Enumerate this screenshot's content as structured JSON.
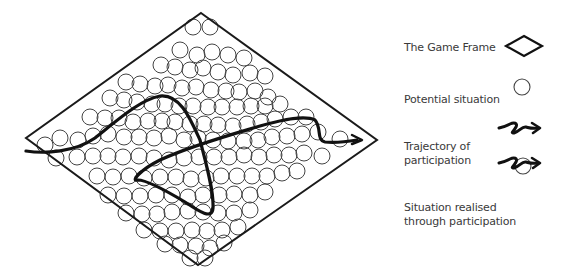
{
  "diagram": {
    "frame_color": "#1a1a1a",
    "circle_color": "#444444",
    "trajectory_color": "#111111",
    "frame": {
      "top": [
        201,
        13
      ],
      "right": [
        377,
        140
      ],
      "bottom": [
        198,
        265
      ],
      "left": [
        26,
        138
      ]
    },
    "circles": [
      [
        193,
        27
      ],
      [
        210,
        27
      ],
      [
        180,
        50
      ],
      [
        197,
        55
      ],
      [
        212,
        52
      ],
      [
        228,
        55
      ],
      [
        244,
        58
      ],
      [
        161,
        65
      ],
      [
        175,
        67
      ],
      [
        190,
        70
      ],
      [
        203,
        68
      ],
      [
        218,
        72
      ],
      [
        233,
        75
      ],
      [
        250,
        73
      ],
      [
        265,
        76
      ],
      [
        126,
        82
      ],
      [
        140,
        84
      ],
      [
        155,
        86
      ],
      [
        168,
        85
      ],
      [
        182,
        88
      ],
      [
        196,
        87
      ],
      [
        211,
        90
      ],
      [
        226,
        91
      ],
      [
        239,
        92
      ],
      [
        255,
        91
      ],
      [
        268,
        97
      ],
      [
        110,
        98
      ],
      [
        124,
        100
      ],
      [
        137,
        102
      ],
      [
        152,
        104
      ],
      [
        165,
        104
      ],
      [
        179,
        106
      ],
      [
        193,
        106
      ],
      [
        208,
        107
      ],
      [
        222,
        107
      ],
      [
        237,
        107
      ],
      [
        251,
        106
      ],
      [
        265,
        106
      ],
      [
        280,
        104
      ],
      [
        90,
        117
      ],
      [
        105,
        118
      ],
      [
        119,
        118
      ],
      [
        133,
        122
      ],
      [
        148,
        121
      ],
      [
        162,
        121
      ],
      [
        175,
        122
      ],
      [
        190,
        124
      ],
      [
        204,
        124
      ],
      [
        218,
        125
      ],
      [
        233,
        126
      ],
      [
        247,
        124
      ],
      [
        261,
        122
      ],
      [
        275,
        119
      ],
      [
        291,
        117
      ],
      [
        306,
        117
      ],
      [
        45,
        145
      ],
      [
        60,
        138
      ],
      [
        78,
        140
      ],
      [
        93,
        136
      ],
      [
        108,
        134
      ],
      [
        124,
        137
      ],
      [
        139,
        137
      ],
      [
        154,
        138
      ],
      [
        169,
        136
      ],
      [
        184,
        140
      ],
      [
        198,
        138
      ],
      [
        213,
        140
      ],
      [
        228,
        141
      ],
      [
        244,
        141
      ],
      [
        258,
        140
      ],
      [
        272,
        137
      ],
      [
        287,
        136
      ],
      [
        302,
        134
      ],
      [
        318,
        132
      ],
      [
        340,
        139
      ],
      [
        56,
        158
      ],
      [
        77,
        157
      ],
      [
        93,
        156
      ],
      [
        108,
        156
      ],
      [
        123,
        157
      ],
      [
        139,
        156
      ],
      [
        154,
        158
      ],
      [
        169,
        160
      ],
      [
        184,
        158
      ],
      [
        199,
        157
      ],
      [
        214,
        157
      ],
      [
        229,
        157
      ],
      [
        244,
        155
      ],
      [
        259,
        157
      ],
      [
        274,
        155
      ],
      [
        289,
        155
      ],
      [
        304,
        153
      ],
      [
        322,
        156
      ],
      [
        97,
        176
      ],
      [
        113,
        177
      ],
      [
        129,
        176
      ],
      [
        144,
        178
      ],
      [
        160,
        177
      ],
      [
        176,
        177
      ],
      [
        191,
        179
      ],
      [
        206,
        178
      ],
      [
        221,
        176
      ],
      [
        237,
        176
      ],
      [
        252,
        176
      ],
      [
        267,
        176
      ],
      [
        282,
        173
      ],
      [
        297,
        171
      ],
      [
        108,
        195
      ],
      [
        124,
        196
      ],
      [
        140,
        196
      ],
      [
        156,
        195
      ],
      [
        172,
        195
      ],
      [
        188,
        197
      ],
      [
        203,
        195
      ],
      [
        219,
        195
      ],
      [
        234,
        194
      ],
      [
        250,
        195
      ],
      [
        265,
        192
      ],
      [
        126,
        213
      ],
      [
        142,
        214
      ],
      [
        157,
        214
      ],
      [
        172,
        212
      ],
      [
        188,
        211
      ],
      [
        203,
        212
      ],
      [
        218,
        213
      ],
      [
        234,
        213
      ],
      [
        250,
        210
      ],
      [
        144,
        230
      ],
      [
        160,
        231
      ],
      [
        176,
        231
      ],
      [
        192,
        230
      ],
      [
        207,
        231
      ],
      [
        222,
        230
      ],
      [
        238,
        227
      ],
      [
        165,
        244
      ],
      [
        180,
        245
      ],
      [
        196,
        246
      ],
      [
        210,
        248
      ],
      [
        224,
        243
      ],
      [
        190,
        258
      ],
      [
        205,
        258
      ]
    ],
    "trajectory_path": "M 26 151 C 45 154, 75 152, 95 138 C 120 118, 140 100, 160 96 C 180 94, 190 118, 200 140 C 205 160, 214 190, 213 208 C 212 220, 200 212, 185 202 C 165 190, 145 180, 138 180 C 130 182, 140 170, 160 160 C 190 146, 230 135, 260 126 C 285 119, 305 115, 315 120 C 322 128, 316 140, 325 142 C 335 143, 345 142, 357 140",
    "arrow_head": "M 352 135 L 362 140 L 352 144"
  },
  "legend": {
    "items": [
      {
        "label": "The Game Frame",
        "icon": "diamond-icon"
      },
      {
        "label": "Potential situation",
        "icon": "circle-icon"
      },
      {
        "label": "Trajectory of\nparticipation",
        "icon": "squiggle-arrow-icon"
      },
      {
        "label": "Situation realised\nthrough participation",
        "icon": "squiggle-arrow-circle-icon"
      }
    ]
  }
}
